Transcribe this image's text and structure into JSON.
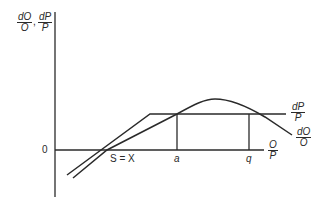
{
  "diagram": {
    "y_axis_label": {
      "part1_num": "dO",
      "part1_den": "O",
      "separator": ",",
      "part2_num": "dP",
      "part2_den": "P"
    },
    "x_axis_label": {
      "num": "O",
      "den": "P"
    },
    "origin_label": "0",
    "points": {
      "intersection": "S = X",
      "a": "a",
      "q": "q"
    },
    "curves": [
      {
        "name": "dP/P",
        "num": "dP",
        "den": "P",
        "shape": "rising line then horizontal plateau"
      },
      {
        "name": "dO/O",
        "num": "dO",
        "den": "O",
        "shape": "rising, peaks between a and q, then falls"
      }
    ],
    "colors": {
      "line": "#2a2a2a",
      "background": "#ffffff"
    }
  }
}
